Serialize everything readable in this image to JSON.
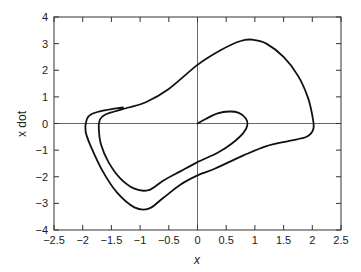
{
  "chart_data": {
    "type": "line",
    "title": "",
    "xlabel": "x",
    "ylabel": "x dot",
    "xlim": [
      -2.5,
      2.5
    ],
    "ylim": [
      -4,
      4
    ],
    "grid": false,
    "legend": null,
    "xticks": [
      -2.5,
      -2,
      -1.5,
      -1,
      -0.5,
      0,
      0.5,
      1,
      1.5,
      2,
      2.5
    ],
    "xtick_labels": [
      "−2.5",
      "−2",
      "−1.5",
      "−1",
      "−0.5",
      "0",
      "0.5",
      "1",
      "1.5",
      "2",
      "2.5"
    ],
    "yticks": [
      -4,
      -3,
      -2,
      -1,
      0,
      1,
      2,
      3,
      4
    ],
    "ytick_labels": [
      "−4",
      "−3",
      "−2",
      "−1",
      "0",
      "1",
      "2",
      "3",
      "4"
    ],
    "reference_lines": [
      {
        "axis": "x",
        "value": 0
      },
      {
        "axis": "y",
        "value": 0
      }
    ],
    "series": [
      {
        "name": "phase trajectory",
        "color": "#111111",
        "x": [
          0.0,
          0.15,
          0.35,
          0.55,
          0.72,
          0.84,
          0.87,
          0.8,
          0.6,
          0.35,
          0.0,
          -0.3,
          -0.6,
          -0.85,
          -1.1,
          -1.35,
          -1.55,
          -1.68,
          -1.72,
          -1.7,
          -1.62,
          -1.45,
          -1.2,
          -0.9,
          -0.5,
          0.0,
          0.4,
          0.75,
          0.95,
          1.2,
          1.5,
          1.75,
          1.92,
          2.0,
          2.02,
          1.9,
          1.6,
          1.2,
          0.8,
          0.3,
          0.0,
          -0.3,
          -0.6,
          -0.85,
          -1.1,
          -1.4,
          -1.65,
          -1.85,
          -1.95,
          -1.93,
          -1.85,
          -1.6,
          -1.3
        ],
        "y": [
          0.0,
          0.18,
          0.38,
          0.45,
          0.4,
          0.2,
          -0.05,
          -0.35,
          -0.75,
          -1.1,
          -1.45,
          -1.8,
          -2.15,
          -2.5,
          -2.45,
          -2.05,
          -1.45,
          -0.8,
          -0.2,
          0.15,
          0.32,
          0.45,
          0.6,
          0.8,
          1.3,
          2.2,
          2.75,
          3.1,
          3.15,
          3.0,
          2.5,
          1.8,
          1.0,
          0.3,
          -0.2,
          -0.5,
          -0.65,
          -0.85,
          -1.2,
          -1.7,
          -1.95,
          -2.3,
          -2.8,
          -3.2,
          -3.15,
          -2.6,
          -1.8,
          -0.9,
          -0.3,
          0.15,
          0.35,
          0.5,
          0.6
        ]
      }
    ]
  }
}
